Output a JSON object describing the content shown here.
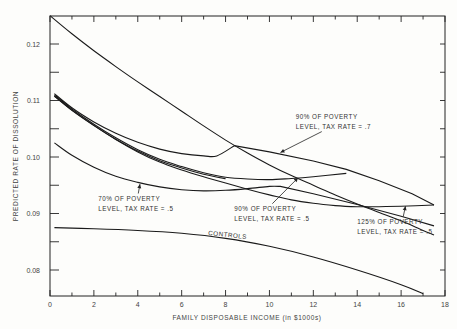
{
  "chart_data": {
    "type": "line",
    "title": "",
    "xlabel": "FAMILY DISPOSABLE INCOME (in $1000s)",
    "ylabel": "PREDICTED RATE OF DISSOLUTION",
    "xlim": [
      0,
      18
    ],
    "ylim": [
      0.0754,
      0.125
    ],
    "grid": false,
    "legend": "none (inline annotations)",
    "x_ticks": [
      0,
      2,
      4,
      6,
      8,
      10,
      12,
      14,
      16,
      18
    ],
    "x_tick_labels": [
      "0",
      "2",
      "4",
      "6",
      "8",
      "10",
      "12",
      "14",
      "16",
      "18"
    ],
    "y_ticks": [
      0.08,
      0.09,
      0.1,
      0.11,
      0.12
    ],
    "y_tick_labels": [
      "0.08",
      "0.09",
      "0.10",
      "0.11",
      "0.12"
    ],
    "series": [
      {
        "name": "Steep curve (unlabeled)",
        "x": [
          0,
          1,
          2,
          3,
          4,
          5,
          6,
          7,
          8,
          9,
          10,
          11,
          12,
          13,
          14,
          15,
          16,
          17,
          17.5
        ],
        "y": [
          0.125,
          0.1218,
          0.1188,
          0.116,
          0.1133,
          0.1107,
          0.1081,
          0.1055,
          0.103,
          0.1007,
          0.0986,
          0.0967,
          0.095,
          0.0933,
          0.0917,
          0.0902,
          0.0887,
          0.087,
          0.0862
        ]
      },
      {
        "name": "90% OF POVERTY LEVEL, TAX RATE = .7",
        "x": [
          0.2,
          1,
          2,
          3,
          4,
          5,
          6,
          7,
          7.6,
          8.4,
          10,
          12,
          13.5,
          15,
          16.5,
          17.5
        ],
        "y": [
          0.1112,
          0.1087,
          0.1062,
          0.1042,
          0.1026,
          0.1014,
          0.1006,
          0.1002,
          0.1002,
          0.102,
          0.1009,
          0.0993,
          0.0978,
          0.0958,
          0.0935,
          0.0915
        ]
      },
      {
        "name": "90% OF POVERTY LEVEL, TAX RATE = .5",
        "x": [
          0.2,
          1,
          2,
          3,
          4,
          5,
          6,
          7,
          8,
          9,
          10,
          11,
          12,
          13.5
        ],
        "y": [
          0.111,
          0.1085,
          0.1058,
          0.1034,
          0.1013,
          0.0996,
          0.0983,
          0.0972,
          0.0964,
          0.0961,
          0.096,
          0.0962,
          0.0965,
          0.0971
        ]
      },
      {
        "name": "70% OF POVERTY LEVEL, TAX RATE = .5",
        "x": [
          0.2,
          1,
          2,
          3,
          4,
          5,
          6,
          7,
          8,
          9,
          10,
          10.5,
          12,
          14,
          16,
          17.5
        ],
        "y": [
          0.1025,
          0.1003,
          0.0982,
          0.0966,
          0.0955,
          0.0947,
          0.0942,
          0.094,
          0.0941,
          0.0944,
          0.0948,
          0.0948,
          0.0935,
          0.0916,
          0.0895,
          0.0878
        ]
      },
      {
        "name": "125% OF POVERTY LEVEL, TAX RATE = .5",
        "x": [
          0.2,
          1,
          2,
          3,
          4,
          5,
          6,
          7,
          8,
          9,
          10,
          11,
          12,
          13,
          14,
          15,
          16,
          17.5
        ],
        "y": [
          0.1108,
          0.1083,
          0.1056,
          0.1031,
          0.1009,
          0.0991,
          0.0977,
          0.0965,
          0.0954,
          0.0943,
          0.0933,
          0.0924,
          0.0918,
          0.0914,
          0.0912,
          0.0912,
          0.0913,
          0.0915
        ]
      },
      {
        "name": "CONTROLS",
        "x": [
          0.2,
          2,
          4,
          6,
          8,
          10,
          12,
          14,
          16,
          17
        ],
        "y": [
          0.0875,
          0.0873,
          0.087,
          0.0865,
          0.0856,
          0.0842,
          0.0823,
          0.08,
          0.0774,
          0.0758
        ]
      }
    ],
    "annotations": [
      {
        "text": [
          "90% OF POVERTY",
          "LEVEL, TAX RATE = .7"
        ],
        "x": 11.2,
        "y": 0.1068,
        "arrow_to": [
          10.5,
          0.1008
        ]
      },
      {
        "text": [
          "70% OF POVERTY",
          "LEVEL, TAX RATE = .5"
        ],
        "x": 2.2,
        "y": 0.0923,
        "arrow_to": [
          4.1,
          0.0952
        ]
      },
      {
        "text": [
          "90% OF POVERTY",
          "LEVEL, TAX RATE = .5"
        ],
        "x": 8.4,
        "y": 0.0905,
        "arrow_to": [
          11.3,
          0.0963
        ]
      },
      {
        "text": [
          "125% OF POVERTY",
          "LEVEL, TAX RATE = .5"
        ],
        "x": 14.0,
        "y": 0.0882,
        "arrow_to": [
          16.2,
          0.0913
        ]
      },
      {
        "text": [
          "CONTROLS"
        ],
        "x": 7.2,
        "y": 0.0862,
        "rotate": 6
      }
    ]
  },
  "axes": {
    "xlabel": "FAMILY DISPOSABLE INCOME (in $1000s)",
    "ylabel": "PREDICTED RATE OF DISSOLUTION"
  }
}
